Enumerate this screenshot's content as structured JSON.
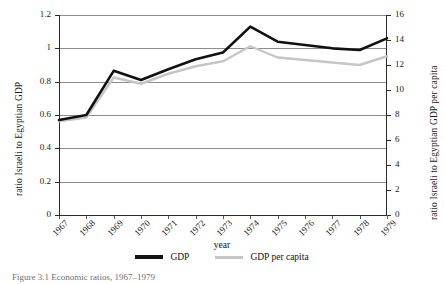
{
  "chart_data": {
    "type": "line",
    "title": "",
    "caption": "Figure 3.1 Economic ratios, 1967–1979",
    "xlabel": "year",
    "ylabel": "ratio Israeli to Egyptian GDP",
    "ylabel_right": "ratio Israeli to Egyptian GDP per capita",
    "categories": [
      "1967",
      "1968",
      "1969",
      "1970",
      "1971",
      "1972",
      "1973",
      "1974",
      "1975",
      "1976",
      "1977",
      "1978",
      "1979"
    ],
    "ylim": [
      0,
      1.2
    ],
    "yticks": [
      "0",
      "0.2",
      "0.4",
      "0.6",
      "0.8",
      "1",
      "1.2"
    ],
    "ytick_values": [
      0,
      0.2,
      0.4,
      0.6,
      0.8,
      1,
      1.2
    ],
    "ylim_right": [
      0,
      16
    ],
    "yticks_right": [
      "0",
      "2",
      "4",
      "6",
      "8",
      "10",
      "12",
      "14",
      "16"
    ],
    "ytick_values_right": [
      0,
      2,
      4,
      6,
      8,
      10,
      12,
      14,
      16
    ],
    "grid": true,
    "legend_position": "bottom",
    "series": [
      {
        "name": "GDP",
        "axis": "left",
        "color": "#111111",
        "values": [
          0.57,
          0.6,
          0.865,
          0.81,
          0.875,
          0.935,
          0.975,
          1.13,
          1.04,
          1.02,
          1.0,
          0.99,
          1.06
        ]
      },
      {
        "name": "GDP per capita",
        "axis": "right",
        "color": "#c6c6c6",
        "values": [
          7.5,
          7.8,
          11.0,
          10.5,
          11.3,
          11.9,
          12.3,
          13.5,
          12.6,
          12.4,
          12.2,
          12.0,
          12.7
        ]
      }
    ]
  },
  "legend": {
    "items": [
      {
        "label": "GDP",
        "color": "#111111"
      },
      {
        "label": "GDP per capita",
        "color": "#c6c6c6"
      }
    ]
  }
}
